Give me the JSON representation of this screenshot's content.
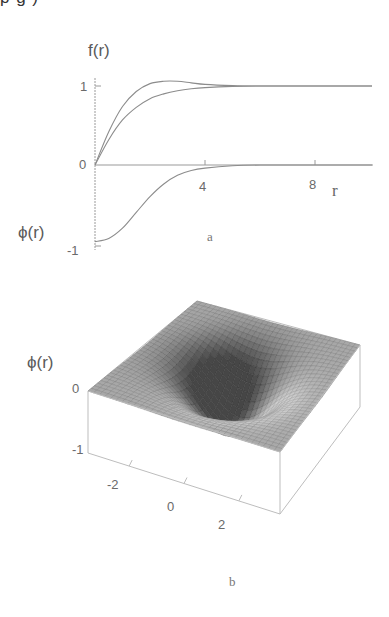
{
  "clipped_header_text": "p  g    )",
  "panel_a": {
    "caption": "a",
    "y_label_top": "f(r)",
    "y_label_bottom": "ϕ(r)",
    "x_label": "r",
    "y_ticks": [
      "1",
      "0",
      "-1"
    ],
    "x_ticks": [
      "4",
      "8"
    ]
  },
  "panel_b": {
    "caption": "b",
    "z_label": "ϕ(r)",
    "z_ticks": [
      "0",
      "-1"
    ],
    "x_ticks": [
      "-2",
      "0",
      "2"
    ]
  },
  "chart_data": [
    {
      "type": "line",
      "title": "a",
      "xlabel": "r",
      "ylabel": "f(r), ϕ(r)",
      "xlim": [
        0,
        10
      ],
      "ylim": [
        -1,
        1.1
      ],
      "xticks": [
        4,
        8
      ],
      "yticks": [
        -1,
        0,
        1
      ],
      "grid": false,
      "legend": "none",
      "series": [
        {
          "name": "f(r) (overshoot)",
          "x": [
            0,
            0.5,
            1,
            1.5,
            2,
            2.5,
            3,
            3.5,
            4,
            5,
            6,
            8,
            10
          ],
          "values": [
            0,
            0.42,
            0.74,
            0.93,
            1.03,
            1.06,
            1.06,
            1.04,
            1.02,
            1.005,
            1.0,
            1.0,
            1.0
          ]
        },
        {
          "name": "f(r) (monotonic)",
          "x": [
            0,
            0.5,
            1,
            1.5,
            2,
            2.5,
            3,
            3.5,
            4,
            5,
            6,
            8,
            10
          ],
          "values": [
            0,
            0.32,
            0.57,
            0.73,
            0.84,
            0.9,
            0.94,
            0.965,
            0.98,
            0.995,
            1.0,
            1.0,
            1.0
          ]
        },
        {
          "name": "ϕ(r)",
          "x": [
            0,
            0.5,
            1,
            1.5,
            2,
            2.5,
            3,
            3.5,
            4,
            5,
            6,
            8,
            10
          ],
          "values": [
            -0.97,
            -0.93,
            -0.8,
            -0.6,
            -0.4,
            -0.24,
            -0.13,
            -0.07,
            -0.04,
            -0.01,
            0,
            0,
            0
          ]
        }
      ]
    },
    {
      "type": "surface",
      "title": "b",
      "xlabel": "",
      "ylabel": "",
      "zlabel": "ϕ(r)",
      "xlim": [
        -3.5,
        3.5
      ],
      "ylim": [
        -3.5,
        3.5
      ],
      "zlim": [
        -1,
        0
      ],
      "xticks": [
        -2,
        0,
        2
      ],
      "zticks": [
        -1,
        0
      ],
      "description": "radially symmetric well, ϕ = -1 at origin, rising to 0 at large r"
    }
  ]
}
